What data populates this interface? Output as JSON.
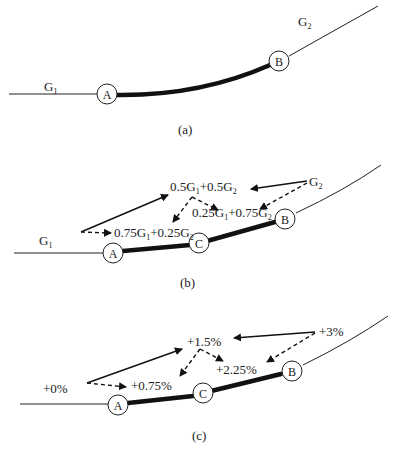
{
  "panels": {
    "a": {
      "caption": "(a)",
      "grade_left": {
        "base": "G",
        "sub": "1"
      },
      "grade_right": {
        "base": "G",
        "sub": "2"
      },
      "node_A": "A",
      "node_B": "B"
    },
    "b": {
      "caption": "(b)",
      "grade_left": {
        "base": "G",
        "sub": "1"
      },
      "grade_right": {
        "base": "G",
        "sub": "2"
      },
      "node_A": "A",
      "node_B": "B",
      "node_C": "C",
      "mid_label": {
        "p1": "0.5G",
        "s1": "1",
        "p2": "+0.5G",
        "s2": "2"
      },
      "ac_label": {
        "p1": "0.75G",
        "s1": "1",
        "p2": "+0.25G",
        "s2": "2"
      },
      "cb_label": {
        "p1": "0.25G",
        "s1": "1",
        "p2": "+0.75G",
        "s2": "2"
      }
    },
    "c": {
      "caption": "(c)",
      "grade_left": "+0%",
      "grade_right": "+3%",
      "mid_label": "+1.5%",
      "ac_label": "+0.75%",
      "cb_label": "+2.25%",
      "node_A": "A",
      "node_B": "B",
      "node_C": "C"
    }
  }
}
